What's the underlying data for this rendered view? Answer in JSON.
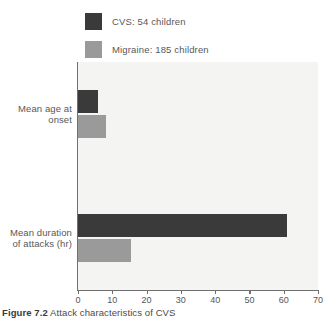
{
  "caption": {
    "number": "Figure 7.2",
    "text": "Attack characteristics of CVS"
  },
  "colors": {
    "cvs": "#3a3a3a",
    "migraine": "#9a9a9a",
    "plot_background": "#f4f4f2",
    "axis": "#6f6f6f",
    "text": "#585858"
  },
  "chart_data": {
    "type": "bar",
    "orientation": "horizontal",
    "title": "",
    "subtitle": "",
    "xlabel": "",
    "ylabel": "",
    "categories": [
      "Mean age at onset",
      "Mean duration of attacks (hr)"
    ],
    "series": [
      {
        "name": "CVS: 54 children",
        "short_name": "CVS",
        "count": 54,
        "color": "#3a3a3a",
        "values": [
          5.8,
          61
        ]
      },
      {
        "name": "Migraine: 185 children",
        "short_name": "Migraine",
        "count": 185,
        "color": "#9a9a9a",
        "values": [
          8.2,
          15.5
        ]
      }
    ],
    "xlim": [
      0,
      70
    ],
    "xticks": [
      0,
      10,
      20,
      30,
      40,
      50,
      60,
      70
    ],
    "xtick_labels": [
      "0",
      "10",
      "20",
      "30",
      "40",
      "50",
      "60",
      "70"
    ],
    "grid": false,
    "legend_position": "top"
  },
  "legend": {
    "items": [
      {
        "label": "CVS: 54 children",
        "color": "#3a3a3a"
      },
      {
        "label": "Migraine: 185 children",
        "color": "#9a9a9a"
      }
    ]
  }
}
